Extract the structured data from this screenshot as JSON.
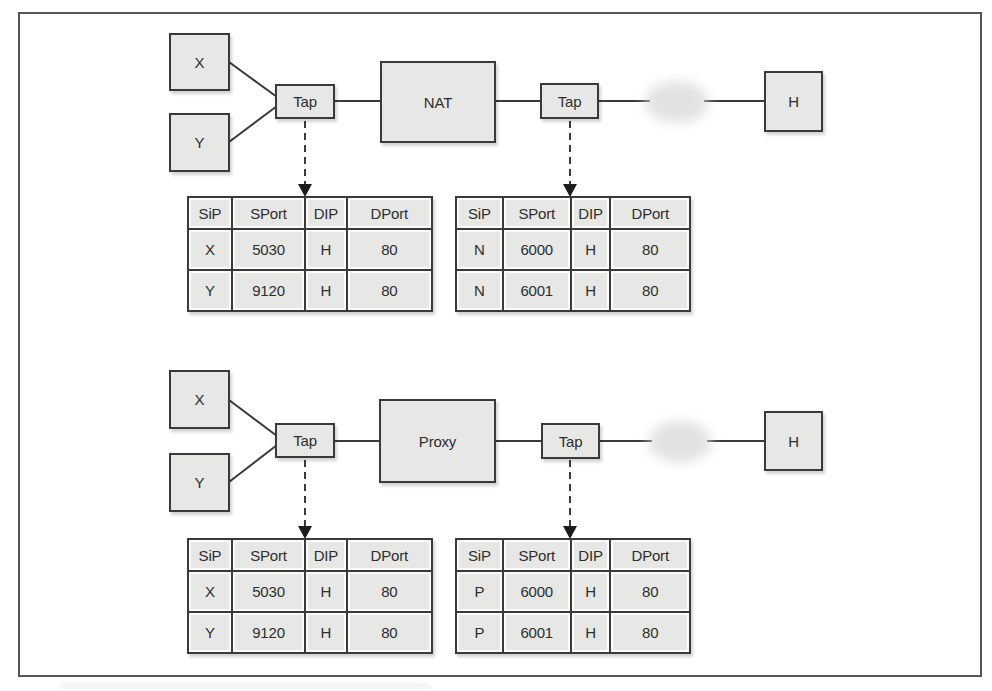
{
  "figure": {
    "frame_color": "#565656",
    "box_fill": "#e7e7e5",
    "box_border": "#3a3a3a",
    "line_color": "#3a3a3a",
    "cloud_color": "#d9d9d7"
  },
  "diagrams": [
    {
      "name": "nat-flow",
      "nodes": {
        "source_a": "X",
        "source_b": "Y",
        "tap_left": "Tap",
        "middle": "NAT",
        "tap_right": "Tap",
        "host": "H"
      },
      "left_table": {
        "headers": [
          "SiP",
          "SPort",
          "DIP",
          "DPort"
        ],
        "rows": [
          [
            "X",
            "5030",
            "H",
            "80"
          ],
          [
            "Y",
            "9120",
            "H",
            "80"
          ]
        ]
      },
      "right_table": {
        "headers": [
          "SiP",
          "SPort",
          "DIP",
          "DPort"
        ],
        "rows": [
          [
            "N",
            "6000",
            "H",
            "80"
          ],
          [
            "N",
            "6001",
            "H",
            "80"
          ]
        ]
      }
    },
    {
      "name": "proxy-flow",
      "nodes": {
        "source_a": "X",
        "source_b": "Y",
        "tap_left": "Tap",
        "middle": "Proxy",
        "tap_right": "Tap",
        "host": "H"
      },
      "left_table": {
        "headers": [
          "SiP",
          "SPort",
          "DIP",
          "DPort"
        ],
        "rows": [
          [
            "X",
            "5030",
            "H",
            "80"
          ],
          [
            "Y",
            "9120",
            "H",
            "80"
          ]
        ]
      },
      "right_table": {
        "headers": [
          "SiP",
          "SPort",
          "DIP",
          "DPort"
        ],
        "rows": [
          [
            "P",
            "6000",
            "H",
            "80"
          ],
          [
            "P",
            "6001",
            "H",
            "80"
          ]
        ]
      }
    }
  ]
}
